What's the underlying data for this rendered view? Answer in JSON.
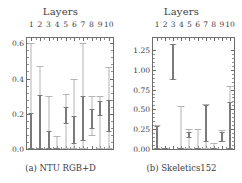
{
  "figure": {
    "panels": [
      {
        "id": "panel-a",
        "title": "Layers",
        "caption": "(a) NTU RGB+D",
        "chart_data": {
          "type": "bar",
          "title": "Layers",
          "subtitle": "(a) NTU RGB+D",
          "xlabel": "Layers",
          "ylabel": "",
          "categories": [
            "1",
            "2",
            "3",
            "4",
            "5",
            "6",
            "7",
            "8",
            "9",
            "10"
          ],
          "xlim": [
            0.5,
            10.5
          ],
          "ylim": [
            0.0,
            0.63
          ],
          "ytick_labels": [
            "0.0",
            "0.2",
            "0.4",
            "0.6"
          ],
          "ytick_values": [
            0.0,
            0.2,
            0.4,
            0.6
          ],
          "yminor_count": 4,
          "grid": false,
          "legend": null,
          "series": [
            {
              "name": "outer-range",
              "color": "#b4b4b4",
              "low": [
                0.0,
                0.0,
                0.0,
                0.0,
                0.0,
                0.0,
                0.0,
                0.075,
                0.0,
                0.0
              ],
              "high": [
                0.6,
                0.47,
                0.3,
                0.075,
                0.31,
                0.4,
                0.6,
                0.3,
                0.3,
                0.465
              ]
            },
            {
              "name": "inner-range",
              "color": "#7a7a7a",
              "low": [
                0.0,
                0.0,
                0.0,
                0.0,
                0.14,
                0.03,
                0.045,
                0.115,
                0.185,
                0.095
              ],
              "high": [
                0.205,
                0.305,
                0.1,
                0.005,
                0.24,
                0.185,
                0.3,
                0.225,
                0.27,
                0.28
              ]
            }
          ]
        }
      },
      {
        "id": "panel-b",
        "title": "Layers",
        "caption": "(b) Skeletics152",
        "chart_data": {
          "type": "bar",
          "title": "Layers",
          "subtitle": "(b) Skeletics152",
          "xlabel": "Layers",
          "ylabel": "",
          "categories": [
            "1",
            "2",
            "3",
            "4",
            "5",
            "6",
            "7",
            "8",
            "9",
            "10"
          ],
          "xlim": [
            0.5,
            10.5
          ],
          "ylim": [
            0.0,
            1.4
          ],
          "ytick_labels": [
            "0.00",
            "0.25",
            "0.50",
            "0.75",
            "1.00",
            "1.25"
          ],
          "ytick_values": [
            0.0,
            0.25,
            0.5,
            0.75,
            1.0,
            1.25
          ],
          "yminor_count": 4,
          "grid": false,
          "legend": null,
          "series": [
            {
              "name": "outer-range",
              "color": "#b4b4b4",
              "low": [
                0.0,
                0.0,
                0.87,
                0.0,
                0.0,
                0.0,
                0.0,
                0.0,
                0.085,
                0.0
              ],
              "high": [
                0.3,
                0.01,
                1.33,
                0.545,
                0.25,
                0.255,
                0.565,
                0.075,
                0.235,
                0.8
              ]
            },
            {
              "name": "inner-range",
              "color": "#7a7a7a",
              "low": [
                0.0,
                0.005,
                0.87,
                0.0,
                0.135,
                0.0,
                0.085,
                0.005,
                0.085,
                0.0
              ],
              "high": [
                0.285,
                0.01,
                1.33,
                0.01,
                0.215,
                0.015,
                0.56,
                0.01,
                0.215,
                0.59
              ]
            }
          ]
        }
      }
    ]
  },
  "geometry": {
    "panel_width": 121,
    "plot_a": {
      "left": 26,
      "top": 37,
      "width": 88,
      "height": 113
    },
    "plot_b": {
      "left": 31,
      "top": 37,
      "width": 83,
      "height": 113
    },
    "caption_top": 163
  }
}
